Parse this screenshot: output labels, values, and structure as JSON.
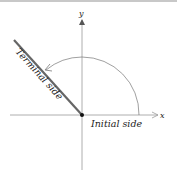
{
  "diagram": {
    "axes": {
      "x_label": "x",
      "y_label": "y"
    },
    "labels": {
      "terminal_side": "Terminal side",
      "initial_side": "Initial side"
    },
    "colors": {
      "axis": "#9a9a9a",
      "terminal_side": "#666666",
      "arc": "#777777",
      "vertex": "#111111",
      "text": "#222222"
    }
  }
}
